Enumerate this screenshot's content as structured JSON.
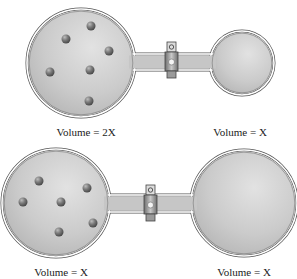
{
  "colors": {
    "background": "#ffffff",
    "glass_fill": "#c9c9c9",
    "glass_outline": "#555555",
    "glass_highlight": "#e4e4e4",
    "particle": "#6e6e6e",
    "valve": "#9a9a9a"
  },
  "apparatus": [
    {
      "id": "top",
      "left_bulb": {
        "cx": 81,
        "cy": 63,
        "r": 54
      },
      "right_bulb": {
        "cx": 242,
        "cy": 63,
        "r": 32
      },
      "tube": {
        "y1": 54,
        "y2": 70
      },
      "valve": {
        "x": 165,
        "knob_y": 42
      },
      "particles": [
        [
          91,
          26
        ],
        [
          66,
          39
        ],
        [
          109,
          51
        ],
        [
          50,
          72
        ],
        [
          90,
          70
        ],
        [
          89,
          101
        ]
      ],
      "left_label": {
        "text": "Volume = 2X",
        "x": 86,
        "y": 126
      },
      "right_label": {
        "text": "Volume = X",
        "x": 240,
        "y": 126
      }
    },
    {
      "id": "bottom",
      "left_bulb": {
        "cx": 56,
        "cy": 203,
        "r": 54
      },
      "right_bulb": {
        "cx": 244,
        "cy": 203,
        "r": 53
      },
      "tube": {
        "y1": 195,
        "y2": 212
      },
      "valve": {
        "x": 144,
        "knob_y": 185
      },
      "particles": [
        [
          39,
          181
        ],
        [
          87,
          188
        ],
        [
          23,
          202
        ],
        [
          61,
          202
        ],
        [
          93,
          223
        ],
        [
          59,
          232
        ]
      ],
      "left_label": {
        "text": "Volume = X",
        "x": 61,
        "y": 266
      },
      "right_label": {
        "text": "Volume = X",
        "x": 244,
        "y": 266
      }
    }
  ]
}
